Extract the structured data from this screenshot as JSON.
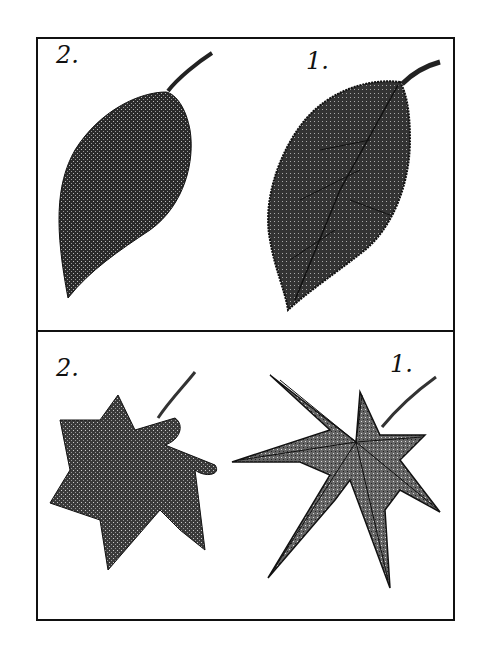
{
  "figure": {
    "panels": [
      {
        "name": "simple-leaves",
        "items": [
          {
            "label": "2.",
            "description": "smooth-edged ovate leaf, stippled texture"
          },
          {
            "label": "1.",
            "description": "serrated ovate leaf with visible veins"
          }
        ]
      },
      {
        "name": "palmate-leaves",
        "items": [
          {
            "label": "2.",
            "description": "round-lobed star-shaped leaf"
          },
          {
            "label": "1.",
            "description": "sharply serrated palmate maple leaf"
          }
        ]
      }
    ],
    "colors": {
      "ink": "#111111",
      "fill": "#555555",
      "paper": "#ffffff"
    }
  }
}
